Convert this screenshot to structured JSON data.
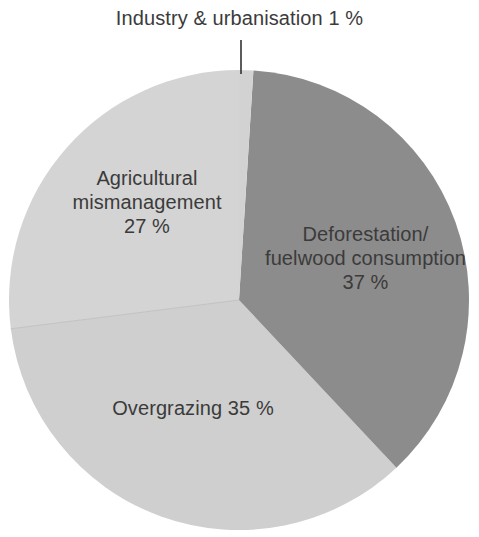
{
  "chart_data": {
    "type": "pie",
    "title": "",
    "subtitle": "",
    "xlabel": "",
    "ylabel": "",
    "legend_position": "none",
    "grid": false,
    "units": "%",
    "categories": [
      "Industry & urbanisation",
      "Deforestation/fuelwood consumption",
      "Overgrazing",
      "Agricultural mismanagement"
    ],
    "values": [
      1,
      37,
      35,
      27
    ],
    "colors": [
      "#d2d2d2",
      "#8c8c8c",
      "#cfcfcf",
      "#d4d4d4"
    ],
    "slices": [
      {
        "name": "Industry & urbanisation",
        "value": 1,
        "value_text": "1 %",
        "label_text": "Industry & urbanisation 1 %",
        "color": "#d2d2d2",
        "start_angle_deg": 0,
        "end_angle_deg": 3.6,
        "label_placement": "outside-callout"
      },
      {
        "name": "Deforestation/fuelwood consumption",
        "value": 37,
        "value_text": "37 %",
        "label_text": "Deforestation/\nfuelwood consumption\n37 %",
        "color": "#8c8c8c",
        "start_angle_deg": 3.6,
        "end_angle_deg": 136.8,
        "label_placement": "inside"
      },
      {
        "name": "Overgrazing",
        "value": 35,
        "value_text": "35 %",
        "label_text": "Overgrazing 35 %",
        "color": "#cfcfcf",
        "start_angle_deg": 136.8,
        "end_angle_deg": 262.8,
        "label_placement": "inside"
      },
      {
        "name": "Agricultural mismanagement",
        "value": 27,
        "value_text": "27 %",
        "label_text": "Agricultural\nmismanagement\n27 %",
        "color": "#d4d4d4",
        "start_angle_deg": 262.8,
        "end_angle_deg": 360,
        "label_placement": "inside"
      }
    ]
  },
  "labels": {
    "callout": "Industry & urbanisation 1 %",
    "deforestation": "Deforestation/\nfuelwood consumption\n37 %",
    "agricultural": "Agricultural\nmismanagement\n27 %",
    "overgrazing": "Overgrazing 35 %"
  },
  "style": {
    "background": "#ffffff",
    "text_color": "#3b3b3b",
    "leader_line_color": "#333333",
    "slice_deforestation": "#8c8c8c",
    "slice_overgrazing": "#cfcfcf",
    "slice_agricultural": "#d4d4d4",
    "slice_industry": "#d2d2d2",
    "divider_color": "#c2c2c2"
  }
}
